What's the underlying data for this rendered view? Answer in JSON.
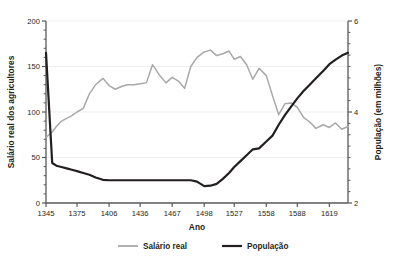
{
  "chart_data": {
    "type": "line",
    "title": "",
    "xlabel": "Ano",
    "ylabel": "Salário real dos agricultores",
    "y2label": "População (em milhões)",
    "grid": true,
    "legend_position": "bottom",
    "x": [
      1345,
      1351,
      1355,
      1360,
      1365,
      1370,
      1375,
      1381,
      1387,
      1393,
      1400,
      1406,
      1412,
      1418,
      1424,
      1430,
      1436,
      1442,
      1448,
      1455,
      1461,
      1467,
      1473,
      1479,
      1485,
      1491,
      1498,
      1504,
      1510,
      1516,
      1522,
      1527,
      1533,
      1539,
      1545,
      1551,
      1558,
      1564,
      1570,
      1576,
      1582,
      1588,
      1594,
      1600,
      1606,
      1613,
      1619,
      1625,
      1631,
      1637
    ],
    "xlim": [
      1345,
      1637
    ],
    "xticks": [
      1345,
      1375,
      1406,
      1436,
      1467,
      1498,
      1527,
      1558,
      1588,
      1619
    ],
    "ylim": [
      0,
      200
    ],
    "yticks": [
      0,
      50,
      100,
      150,
      200
    ],
    "y_minor_ticks": [
      10,
      20,
      30,
      40,
      60,
      70,
      80,
      90,
      110,
      120,
      130,
      140,
      160,
      170,
      180,
      190
    ],
    "y2lim": [
      2,
      6
    ],
    "y2ticks": [
      2,
      4,
      6
    ],
    "y2_minor_ticks": [
      2.25,
      2.5,
      2.75,
      3.0,
      3.25,
      3.5,
      3.75,
      4.25,
      4.5,
      4.75,
      5.0,
      5.25,
      5.5,
      5.75
    ],
    "gridlines": [
      50,
      100,
      150,
      200
    ],
    "series": [
      {
        "name": "Salário real",
        "axis": "left",
        "color": "#a8a8a8",
        "values": [
          72,
          78,
          84,
          90,
          93,
          96,
          100,
          104,
          120,
          130,
          137,
          129,
          125,
          128,
          130,
          130,
          131,
          132,
          152,
          140,
          132,
          138,
          134,
          126,
          150,
          160,
          166,
          168,
          162,
          164,
          167,
          158,
          161,
          152,
          136,
          148,
          140,
          118,
          97,
          109,
          110,
          105,
          94,
          89,
          82,
          86,
          83,
          88,
          81,
          84
        ]
      },
      {
        "name": "População",
        "axis": "right",
        "color": "#231f20",
        "values": [
          5.3,
          2.88,
          2.82,
          2.79,
          2.76,
          2.73,
          2.7,
          2.66,
          2.62,
          2.56,
          2.51,
          2.5,
          2.5,
          2.5,
          2.5,
          2.5,
          2.5,
          2.5,
          2.5,
          2.5,
          2.5,
          2.5,
          2.5,
          2.5,
          2.5,
          2.47,
          2.37,
          2.38,
          2.42,
          2.53,
          2.66,
          2.79,
          2.92,
          3.05,
          3.18,
          3.2,
          3.35,
          3.48,
          3.72,
          3.93,
          4.12,
          4.3,
          4.46,
          4.6,
          4.74,
          4.9,
          5.05,
          5.15,
          5.24,
          5.3
        ]
      }
    ],
    "legend": [
      {
        "label": "Salário real",
        "color": "#a8a8a8"
      },
      {
        "label": "População",
        "color": "#231f20"
      }
    ]
  }
}
